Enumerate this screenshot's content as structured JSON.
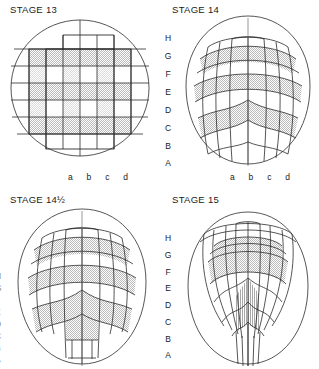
{
  "figure": {
    "type": "fate-map-series",
    "background_color": "#ffffff",
    "line_color": "#2b2b2b",
    "shade_color": "#d2d2d2"
  },
  "panels": [
    {
      "id": "stage-13",
      "title": "STAGE 13",
      "position": "top-left",
      "shape": "circle",
      "row_labels": [],
      "column_labels": [
        "a",
        "b",
        "c",
        "d"
      ],
      "grid": {
        "rows": 8,
        "cols": 8,
        "deformation": "none-orthogonal"
      }
    },
    {
      "id": "stage-14",
      "title": "STAGE 14",
      "position": "top-right",
      "shape": "oval",
      "row_labels": [
        "H",
        "G",
        "F",
        "E",
        "D",
        "C",
        "B",
        "A"
      ],
      "column_labels": [
        "a",
        "b",
        "c",
        "d"
      ],
      "grid": {
        "rows": 8,
        "cols": 8,
        "deformation": "arched-convergent"
      }
    },
    {
      "id": "stage-14-half",
      "title": "STAGE 14½",
      "position": "bottom-left",
      "shape": "oval",
      "row_labels": [
        "H",
        "G",
        "F",
        "E",
        "D",
        "C",
        "B",
        "A"
      ],
      "column_labels": [],
      "grid": {
        "rows": 8,
        "cols": 8,
        "deformation": "arched-extending"
      }
    },
    {
      "id": "stage-15",
      "title": "STAGE 15",
      "position": "bottom-right",
      "shape": "oval",
      "row_labels": [
        "H",
        "G",
        "F",
        "E",
        "D",
        "C",
        "B",
        "A"
      ],
      "column_labels": [],
      "grid": {
        "rows": 8,
        "cols": 8,
        "deformation": "fan-converged-elongated"
      }
    }
  ],
  "legend": {
    "row_axis_letters": [
      "H",
      "G",
      "F",
      "E",
      "D",
      "C",
      "B",
      "A"
    ],
    "column_axis_letters": [
      "a",
      "b",
      "c",
      "d"
    ]
  }
}
